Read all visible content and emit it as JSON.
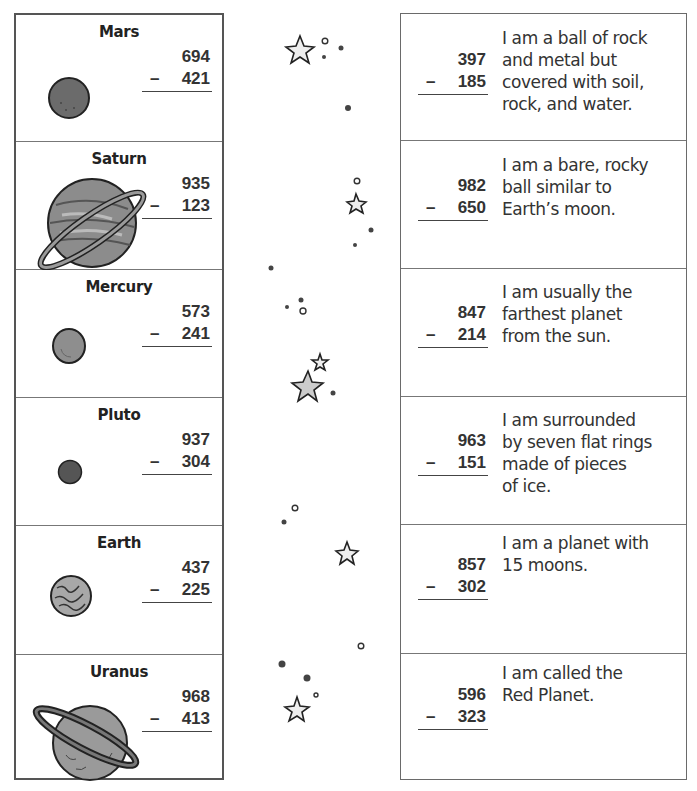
{
  "planets": [
    {
      "name": "Mars",
      "top": "694",
      "bottom": "421",
      "operator": "–"
    },
    {
      "name": "Saturn",
      "top": "935",
      "bottom": "123",
      "operator": "–"
    },
    {
      "name": "Mercury",
      "top": "573",
      "bottom": "241",
      "operator": "–"
    },
    {
      "name": "Pluto",
      "top": "937",
      "bottom": "304",
      "operator": "–"
    },
    {
      "name": "Earth",
      "top": "437",
      "bottom": "225",
      "operator": "–"
    },
    {
      "name": "Uranus",
      "top": "968",
      "bottom": "413",
      "operator": "–"
    }
  ],
  "clues": [
    {
      "top": "397",
      "bottom": "185",
      "operator": "–",
      "lines": [
        "I am a ball of rock",
        "and metal but",
        "covered with soil,",
        "rock, and water."
      ]
    },
    {
      "top": "982",
      "bottom": "650",
      "operator": "–",
      "lines": [
        "I am a bare, rocky",
        "ball similar to",
        "Earth’s moon."
      ]
    },
    {
      "top": "847",
      "bottom": "214",
      "operator": "–",
      "lines": [
        "I am usually the",
        "farthest planet",
        "from the sun."
      ]
    },
    {
      "top": "963",
      "bottom": "151",
      "operator": "–",
      "lines": [
        "I am surrounded",
        "by seven flat rings",
        "made of pieces",
        "of ice."
      ]
    },
    {
      "top": "857",
      "bottom": "302",
      "operator": "–",
      "lines": [
        "I am a planet with",
        "15 moons."
      ]
    },
    {
      "top": "596",
      "bottom": "323",
      "operator": "–",
      "lines": [
        "I am called the",
        "Red Planet."
      ]
    }
  ],
  "decorations": {
    "icon": "star-icon",
    "dots": "dot-icon"
  }
}
